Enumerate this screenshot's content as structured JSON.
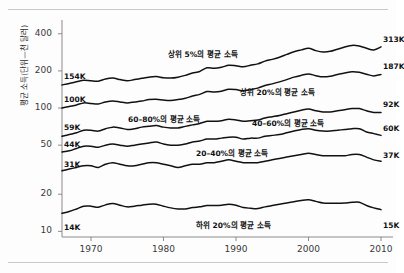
{
  "chart_data": {
    "type": "line",
    "title": "",
    "xlabel": "",
    "ylabel": "평균 소득(단위—천 달러)",
    "xlim": [
      1966,
      2010
    ],
    "ylim": [
      9,
      480
    ],
    "yscale": "log",
    "grid": false,
    "legend_position": "inline-annotations",
    "xticks": [
      "1970",
      "1980",
      "1990",
      "2000",
      "2010"
    ],
    "xtick_values": [
      1970,
      1980,
      1990,
      2000,
      2010
    ],
    "yticks": [
      "400",
      "200",
      "100",
      "50",
      "20",
      "10"
    ],
    "ytick_values": [
      400,
      200,
      100,
      50,
      20,
      10
    ],
    "x": [
      1966,
      1967,
      1968,
      1969,
      1970,
      1971,
      1972,
      1973,
      1974,
      1975,
      1976,
      1977,
      1978,
      1979,
      1980,
      1981,
      1982,
      1983,
      1984,
      1985,
      1986,
      1987,
      1988,
      1989,
      1990,
      1991,
      1992,
      1993,
      1994,
      1995,
      1996,
      1997,
      1998,
      1999,
      2000,
      2001,
      2002,
      2003,
      2004,
      2005,
      2006,
      2007,
      2008,
      2009,
      2010
    ],
    "series": [
      {
        "name": "상위 5%의 평균 소득",
        "start_label": "154K",
        "end_label": "313K",
        "annotation": "상위 5%의 평균 소득",
        "values": [
          154,
          158,
          163,
          168,
          166,
          165,
          172,
          175,
          170,
          166,
          170,
          174,
          178,
          180,
          176,
          175,
          178,
          184,
          192,
          198,
          212,
          210,
          214,
          222,
          220,
          216,
          222,
          228,
          240,
          248,
          258,
          272,
          286,
          296,
          305,
          292,
          285,
          288,
          300,
          312,
          322,
          318,
          305,
          296,
          313
        ]
      },
      {
        "name": "상위 20%의 평균 소득",
        "start_label": "100K",
        "end_label": "187K",
        "annotation": "상위 20%의 평균 소득",
        "values": [
          100,
          103,
          106,
          110,
          109,
          108,
          112,
          114,
          112,
          110,
          112,
          114,
          117,
          118,
          116,
          115,
          117,
          120,
          125,
          129,
          136,
          135,
          137,
          142,
          141,
          138,
          141,
          145,
          152,
          157,
          163,
          170,
          178,
          184,
          189,
          183,
          179,
          181,
          187,
          192,
          197,
          195,
          188,
          182,
          187
        ]
      },
      {
        "name": "60–80%의 평균 소득",
        "start_label": "59K",
        "end_label": "92K",
        "annotation": "60–80%의 평균 소득",
        "values": [
          59,
          61,
          63,
          66,
          66,
          65,
          68,
          70,
          69,
          67,
          68,
          70,
          71,
          72,
          70,
          69,
          69,
          71,
          73,
          75,
          78,
          78,
          79,
          81,
          80,
          78,
          79,
          80,
          83,
          85,
          87,
          90,
          93,
          96,
          98,
          95,
          93,
          93,
          95,
          97,
          99,
          99,
          95,
          92,
          92
        ]
      },
      {
        "name": "40–60%의 평균 소득",
        "start_label": "44K",
        "end_label": "60K",
        "annotation": "40–60%의 평균 소득",
        "values": [
          44,
          45,
          47,
          49,
          49,
          48,
          50,
          51,
          50,
          49,
          50,
          51,
          52,
          53,
          51,
          50,
          50,
          51,
          53,
          54,
          56,
          56,
          57,
          58,
          58,
          56,
          57,
          57,
          59,
          60,
          61,
          63,
          65,
          67,
          68,
          66,
          65,
          65,
          66,
          67,
          68,
          68,
          64,
          62,
          60
        ]
      },
      {
        "name": "20–40%의 평균 소득",
        "start_label": "31K",
        "end_label": "37K",
        "annotation": "20–40%의 평균 소득",
        "values": [
          31,
          32,
          33,
          34,
          34,
          33,
          35,
          36,
          35,
          34,
          34,
          35,
          36,
          36,
          35,
          34,
          33,
          34,
          35,
          35,
          36,
          36,
          37,
          38,
          37,
          36,
          36,
          36,
          37,
          38,
          39,
          40,
          41,
          42,
          43,
          42,
          41,
          41,
          41,
          41,
          42,
          42,
          40,
          38,
          37
        ]
      },
      {
        "name": "하위 20%의 평균 소득",
        "start_label": "14K",
        "end_label": "15K",
        "annotation": "하위 20%의 평균 소득",
        "values": [
          14,
          14.5,
          15.2,
          16,
          16,
          15.7,
          16.4,
          16.8,
          16.3,
          15.8,
          16,
          16.3,
          16.6,
          16.6,
          16,
          15.5,
          15.2,
          15.2,
          15.6,
          15.8,
          16.2,
          16.2,
          16.3,
          16.6,
          16.3,
          15.6,
          15.4,
          15.3,
          15.8,
          16.2,
          16.6,
          17,
          17.4,
          17.8,
          18,
          17.5,
          17,
          16.9,
          16.9,
          17,
          17.2,
          17.2,
          16.2,
          15.5,
          15
        ]
      }
    ]
  },
  "axis": {
    "y_title": "평균 소득(단위—천 달러)"
  }
}
